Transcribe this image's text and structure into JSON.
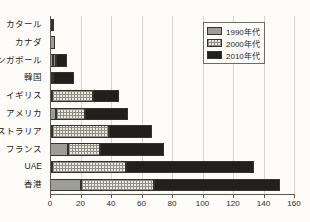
{
  "chart_data": {
    "type": "bar",
    "orientation": "horizontal",
    "stacked": true,
    "title": "",
    "xlabel": "",
    "ylabel": "",
    "xlim": [
      0,
      160
    ],
    "xticks": [
      0,
      20,
      40,
      60,
      80,
      100,
      120,
      140,
      160
    ],
    "xtick_labels": [
      "0",
      "20",
      "40",
      "60",
      "80",
      "100",
      "120",
      "140",
      "160"
    ],
    "grid": true,
    "grid_axis": "x",
    "legend_position": "top-right",
    "categories": [
      "カタール",
      "カナダ",
      "シンガポール",
      "韓国",
      "イギリス",
      "アメリカ",
      "オーストラリア",
      "フランス",
      "UAE",
      "香港"
    ],
    "series": [
      {
        "name": "1990年代",
        "color": "#9d9d97",
        "pattern": "solid-gray",
        "values": [
          1,
          3,
          2,
          1,
          1,
          4,
          1,
          12,
          1,
          20
        ]
      },
      {
        "name": "2000年代",
        "color": "#e9e8e1",
        "pattern": "checkered",
        "values": [
          0,
          0,
          2,
          1,
          27,
          19,
          38,
          21,
          49,
          48
        ]
      },
      {
        "name": "2010年代",
        "color": "#231f1c",
        "pattern": "solid-black",
        "values": [
          1,
          0,
          7,
          14,
          17,
          28,
          28,
          42,
          84,
          83
        ]
      }
    ],
    "totals": [
      2,
      3,
      11,
      16,
      45,
      51,
      67,
      75,
      134,
      151
    ]
  },
  "legend": {
    "items": [
      {
        "label": "1990年代",
        "swatch": "seg-1990"
      },
      {
        "label": "2000年代",
        "swatch": "seg-2000"
      },
      {
        "label": "2010年代",
        "swatch": "seg-2010"
      }
    ]
  },
  "artifact": {
    "top_text": ""
  }
}
